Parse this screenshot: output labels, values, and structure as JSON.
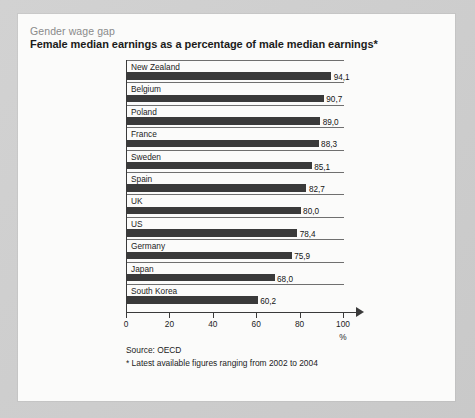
{
  "header": {
    "kicker": "Gender wage gap",
    "headline": "Female median earnings as a percentage of male median earnings*"
  },
  "notes": {
    "source": "Source: OECD",
    "footnote": "* Latest available figures ranging from 2002 to 2004"
  },
  "axis": {
    "unit": "%",
    "ticks": [
      "0",
      "20",
      "40",
      "60",
      "80",
      "100"
    ]
  },
  "colors": {
    "bar": "#3a3a3a",
    "axis": "#3a3a3a",
    "card": "#fbfbfa",
    "page": "#cfcfcf",
    "kicker": "#8a8a8a"
  },
  "chart_data": {
    "type": "bar",
    "orientation": "horizontal",
    "title": "Gender wage gap",
    "subtitle": "Female median earnings as a percentage of male median earnings*",
    "xlabel": "%",
    "ylabel": "",
    "xlim": [
      0,
      100
    ],
    "xticks": [
      0,
      20,
      40,
      60,
      80,
      100
    ],
    "grid": false,
    "legend": false,
    "categories": [
      "New Zealand",
      "Belgium",
      "Poland",
      "France",
      "Sweden",
      "Spain",
      "UK",
      "US",
      "Germany",
      "Japan",
      "South Korea"
    ],
    "values": [
      94.1,
      90.7,
      89.0,
      88.3,
      85.1,
      82.7,
      80.0,
      78.4,
      75.9,
      68.0,
      60.2
    ],
    "value_labels": [
      "94,1",
      "90,7",
      "89,0",
      "88,3",
      "85,1",
      "82,7",
      "80,0",
      "78,4",
      "75,9",
      "68,0",
      "60,2"
    ],
    "source": "Source: OECD",
    "annotation": "* Latest available figures ranging from 2002 to 2004"
  }
}
